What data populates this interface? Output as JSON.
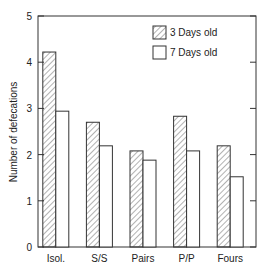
{
  "chart_data": {
    "type": "bar",
    "title": "",
    "xlabel": "",
    "ylabel": "Number of defecations",
    "ylim": [
      0,
      5
    ],
    "yticks": [
      0,
      1,
      2,
      3,
      4,
      5
    ],
    "grid": false,
    "legend_position": "top-right",
    "categories": [
      "Isol.",
      "S/S",
      "Pairs",
      "P/P",
      "Fours"
    ],
    "series": [
      {
        "name": "3 Days old",
        "pattern": "hatched",
        "values": [
          4.22,
          2.7,
          2.08,
          2.83,
          2.19
        ]
      },
      {
        "name": "7 Days old",
        "pattern": "open",
        "values": [
          2.94,
          2.19,
          1.88,
          2.08,
          1.52
        ]
      }
    ]
  },
  "colors": {
    "axis": "#333333",
    "hatch": "#555555",
    "fill_open": "#ffffff"
  }
}
